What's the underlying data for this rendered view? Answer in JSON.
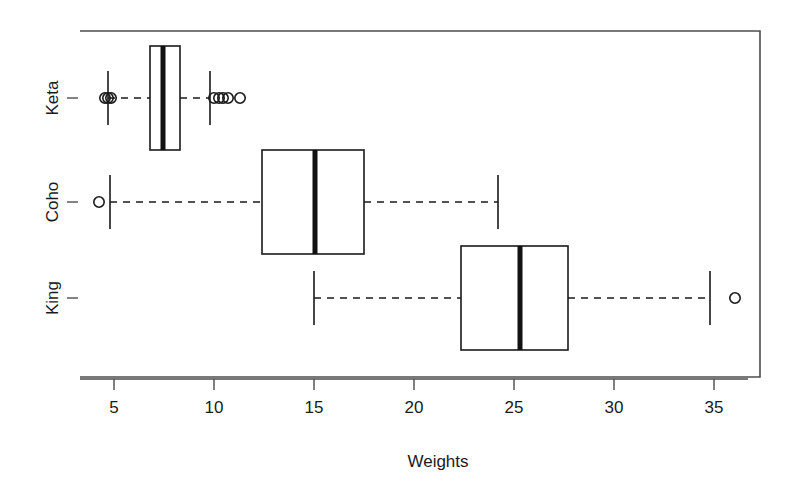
{
  "chart_data": {
    "type": "box",
    "orientation": "horizontal",
    "title": "",
    "xlabel": "Weights",
    "ylabel": "",
    "xlim": [
      3.3,
      37.5
    ],
    "grid": false,
    "legend": "none",
    "x_ticks": [
      5,
      10,
      15,
      20,
      25,
      30,
      35
    ],
    "x_tick_labels": [
      "5",
      "10",
      "15",
      "20",
      "25",
      "30",
      "35"
    ],
    "categories": [
      "King",
      "Coho",
      "Keta"
    ],
    "category_labels_top_to_bottom": [
      "Keta",
      "Coho",
      "King"
    ],
    "boxes": [
      {
        "name": "Keta",
        "whisker_low": 4.7,
        "q1": 6.8,
        "median": 7.45,
        "q3": 8.3,
        "whisker_high": 9.8,
        "outliers": [
          4.55,
          4.7,
          4.85,
          10.0,
          10.25,
          10.45,
          10.7,
          11.3
        ]
      },
      {
        "name": "Coho",
        "whisker_low": 4.8,
        "q1": 12.4,
        "median": 15.05,
        "q3": 17.5,
        "whisker_high": 24.2,
        "outliers": [
          4.25
        ]
      },
      {
        "name": "King",
        "whisker_low": 15.0,
        "q1": 22.35,
        "median": 25.3,
        "q3": 27.7,
        "whisker_high": 34.8,
        "outliers": [
          36.05
        ]
      }
    ],
    "style": {
      "box_fill": "#ffffff",
      "box_stroke": "#1a1a1a",
      "median_color": "#111111",
      "whisker_style": "dashed",
      "outlier_marker": "open-circle",
      "frame_color": "#4d4d4d"
    }
  },
  "axis": {
    "x_title": "Weights"
  }
}
